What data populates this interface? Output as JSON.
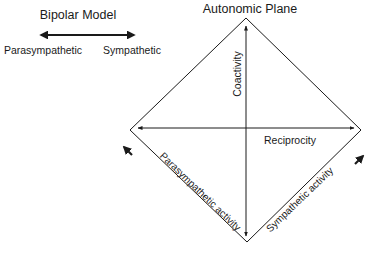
{
  "bipolar_model": {
    "title": "Bipolar Model",
    "left_label": "Parasympathetic",
    "right_label": "Sympathetic"
  },
  "autonomic_plane": {
    "title": "Autonomic Plane",
    "vertical_axis_label": "Coactivity",
    "horizontal_axis_label": "Reciprocity",
    "lower_left_edge_label": "Parasympathetic activity",
    "lower_right_edge_label": "Sympathetic activity"
  },
  "colors": {
    "line": "#1a1a1a",
    "text": "#1a1a1a",
    "background": "#ffffff"
  }
}
